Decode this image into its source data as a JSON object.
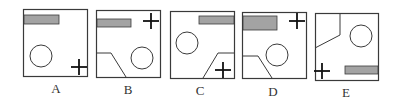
{
  "colors": {
    "stroke": "#3a3a3a",
    "bar_fill": "#a3a3a3",
    "background": "#ffffff"
  },
  "options": [
    {
      "label": "A",
      "box": {
        "x": 23,
        "y": 9,
        "w": 64,
        "h": 67
      },
      "bar": {
        "x": 1,
        "y": 6,
        "w": 35,
        "h": 9
      },
      "circle": {
        "cx": 18,
        "cy": 47,
        "r": 11
      },
      "plus": {
        "cx": 56,
        "cy": 58,
        "s": 8
      },
      "polyline": null,
      "label_pos": {
        "x": 46,
        "y": 81
      }
    },
    {
      "label": "B",
      "box": {
        "x": 96,
        "y": 10,
        "w": 64,
        "h": 67
      },
      "bar": {
        "x": 1,
        "y": 9,
        "w": 34,
        "h": 8
      },
      "circle": {
        "cx": 46,
        "cy": 48,
        "r": 11
      },
      "plus": {
        "cx": 55,
        "cy": 11,
        "s": 8
      },
      "polyline": "0,43 15,43 30,67",
      "label_pos": {
        "x": 118,
        "y": 82
      }
    },
    {
      "label": "C",
      "box": {
        "x": 170,
        "y": 11,
        "w": 64,
        "h": 67
      },
      "bar": {
        "x": 29,
        "y": 5,
        "w": 35,
        "h": 8
      },
      "circle": {
        "cx": 17,
        "cy": 32,
        "r": 11
      },
      "plus": {
        "cx": 53,
        "cy": 59,
        "s": 8
      },
      "polyline": "64,42 48,42 33,67",
      "label_pos": {
        "x": 190,
        "y": 83
      }
    },
    {
      "label": "D",
      "box": {
        "x": 242,
        "y": 12,
        "w": 64,
        "h": 66
      },
      "bar": {
        "x": 1,
        "y": 4,
        "w": 34,
        "h": 14
      },
      "circle": {
        "cx": 35,
        "cy": 43,
        "r": 11
      },
      "plus": {
        "cx": 55,
        "cy": 9,
        "s": 8
      },
      "polyline": "0,44 16,44 30,66",
      "label_pos": {
        "x": 263,
        "y": 84
      }
    },
    {
      "label": "E",
      "box": {
        "x": 315,
        "y": 13,
        "w": 63,
        "h": 67
      },
      "bar": {
        "x": 30,
        "y": 53,
        "w": 33,
        "h": 8
      },
      "circle": {
        "cx": 46,
        "cy": 23,
        "r": 11
      },
      "plus": {
        "cx": 7,
        "cy": 58,
        "s": 8
      },
      "polyline": "0,35 25,22 25,0",
      "label_pos": {
        "x": 336,
        "y": 85
      }
    }
  ]
}
